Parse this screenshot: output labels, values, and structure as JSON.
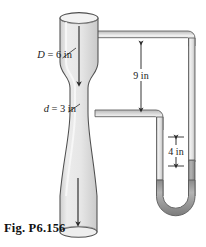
{
  "figure": {
    "caption": "Fig. P6.156",
    "type": "venturi-meter-with-mercury-manometer",
    "background": "#ffffff",
    "labels": {
      "upstream_diameter": "D = 6 in",
      "upstream_diameter_symbol": "D",
      "upstream_diameter_value": "= 6 in",
      "throat_diameter": "d = 3 in",
      "throat_diameter_symbol": "d",
      "throat_diameter_value": "= 3 in",
      "vertical_drop": "9 in",
      "manometer_deflection": "4 in"
    },
    "colors": {
      "pipe_fill": "#e3e3e3",
      "pipe_edge": "#555555",
      "tube_fill": "#d2d2d2",
      "mercury_fill": "#9d9d9d",
      "arrow": "#2b2b2b",
      "text": "#1a1a1a"
    },
    "flow_arrows": [
      {
        "name": "flow-arrow-upper",
        "direction": "down"
      },
      {
        "name": "flow-arrow-lower",
        "direction": "down"
      }
    ]
  }
}
